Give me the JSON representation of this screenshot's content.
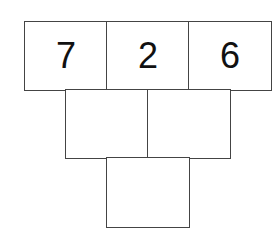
{
  "pyramid": {
    "rows": [
      {
        "cells": [
          {
            "value": "7"
          },
          {
            "value": "2"
          },
          {
            "value": "6"
          }
        ]
      },
      {
        "cells": [
          {
            "value": ""
          },
          {
            "value": ""
          }
        ]
      },
      {
        "cells": [
          {
            "value": ""
          }
        ]
      }
    ]
  }
}
